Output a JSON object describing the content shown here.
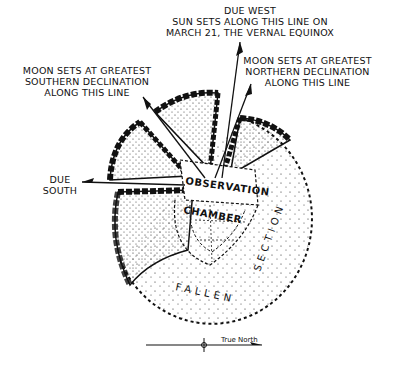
{
  "labels": {
    "due_west": "DUE WEST",
    "sun_line1": "SUN SETS ALONG THIS LINE ON",
    "sun_line2": "MARCH 21, THE VERNAL EQUINOX",
    "moon_south_line1": "MOON SETS AT GREATEST",
    "moon_south_line2": "SOUTHERN DECLINATION",
    "moon_south_line3": "ALONG THIS LINE",
    "moon_north_line1": "MOON SETS AT GREATEST",
    "moon_north_line2": "NORTHERN DECLINATION",
    "moon_north_line3": "ALONG THIS LINE",
    "due_south_line1": "DUE",
    "due_south_line2": "SOUTH",
    "chamber_line1": "OBSERVATION",
    "chamber_line2": "CHAMBER",
    "fallen": "FALLEN",
    "section": "SECTION",
    "true_north": "True North"
  },
  "colors": {
    "ink": "#111111",
    "background": "#ffffff"
  }
}
